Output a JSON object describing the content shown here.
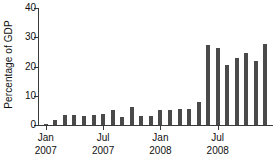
{
  "chart_data": {
    "type": "bar",
    "title": "",
    "xlabel": "",
    "ylabel": "Percentage of GDP",
    "ylim": [
      0,
      40
    ],
    "yticks": [
      0,
      10,
      20,
      30,
      40
    ],
    "ytick_labels": [
      "0",
      "10",
      "20",
      "30",
      "40"
    ],
    "grid": false,
    "legend": false,
    "bar_color": "#4a4a4a",
    "axis_color": "#3a3a3a",
    "background_color": "#ffffff",
    "categories": [
      "Jan 2007",
      "Feb 2007",
      "Mar 2007",
      "Apr 2007",
      "May 2007",
      "Jun 2007",
      "Jul 2007",
      "Aug 2007",
      "Sep 2007",
      "Oct 2007",
      "Nov 2007",
      "Dec 2007",
      "Jan 2008",
      "Feb 2008",
      "Mar 2008",
      "Apr 2008",
      "May 2008",
      "Jun 2008",
      "Jul 2008",
      "Aug 2008",
      "Sep 2008",
      "Oct 2008",
      "Nov 2008",
      "Dec 2008"
    ],
    "values": [
      0.4,
      1.6,
      3.3,
      3.3,
      3.1,
      3.4,
      3.7,
      5.0,
      2.8,
      6.3,
      3.0,
      3.2,
      5.3,
      5.3,
      5.6,
      5.4,
      8.0,
      27.5,
      26.5,
      20.5,
      23.0,
      24.5,
      22.0,
      27.8
    ],
    "xtick_labels": [
      {
        "line1": "Jan",
        "line2": "2007",
        "category_index": 0
      },
      {
        "line1": "Jul",
        "line2": "2007",
        "category_index": 6
      },
      {
        "line1": "Jan",
        "line2": "2008",
        "category_index": 12
      },
      {
        "line1": "Jul",
        "line2": "2008",
        "category_index": 18
      }
    ]
  }
}
